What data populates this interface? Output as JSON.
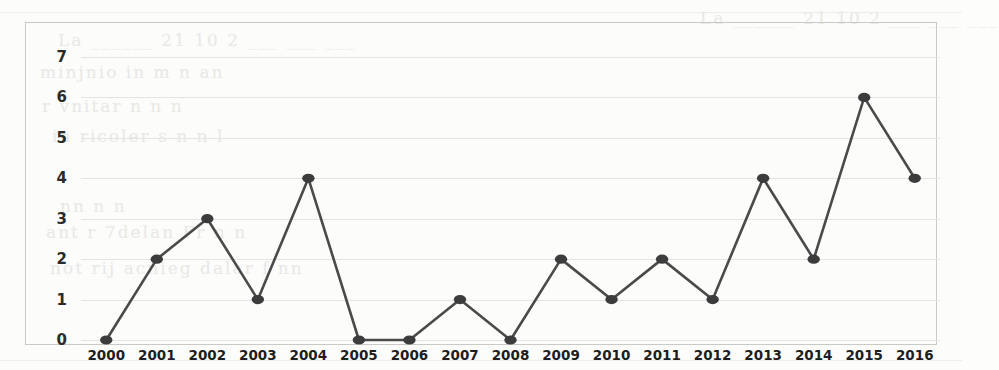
{
  "chart_data": {
    "type": "line",
    "title": "",
    "subtitle": "",
    "xlabel": "",
    "ylabel": "",
    "categories": [
      "2000",
      "2001",
      "2002",
      "2003",
      "2004",
      "2005",
      "2006",
      "2007",
      "2008",
      "2009",
      "2010",
      "2011",
      "2012",
      "2013",
      "2014",
      "2015",
      "2016"
    ],
    "values": [
      0,
      2,
      3,
      1,
      4,
      0,
      0,
      1,
      0,
      2,
      1,
      2,
      1,
      4,
      2,
      6,
      4
    ],
    "series": [
      {
        "name": "",
        "values": [
          0,
          2,
          3,
          1,
          4,
          0,
          0,
          1,
          0,
          2,
          1,
          2,
          1,
          4,
          2,
          6,
          4
        ]
      }
    ],
    "ylim": [
      0,
      7
    ],
    "yticks": [
      0,
      1,
      2,
      3,
      4,
      5,
      6,
      7
    ],
    "ytick_labels": [
      "0",
      "1",
      "2",
      "3",
      "4",
      "5",
      "6",
      "7"
    ],
    "grid": true,
    "legend": false,
    "legend_position": "none",
    "markers": true,
    "marker_shape": "circle",
    "line_color": "#4a4a4a",
    "marker_color": "#3c3c3c",
    "grid_color": "#e4e4e2",
    "frame_color": "#c9c9c5",
    "background_color": "#fcfcfa"
  },
  "scan_artifacts": {
    "bleed_text": [
      "La ______ 21 10 2 ___  ___  ___",
      "minjnio  in  m      n      an",
      "r  vnitar  n         n     n",
      "in   ricoler  s  n      n     l",
      "nn     n          n",
      "ant      r  7delan  Fr   n       n",
      "not  rij  acnieg   dalar  f     nn"
    ]
  }
}
